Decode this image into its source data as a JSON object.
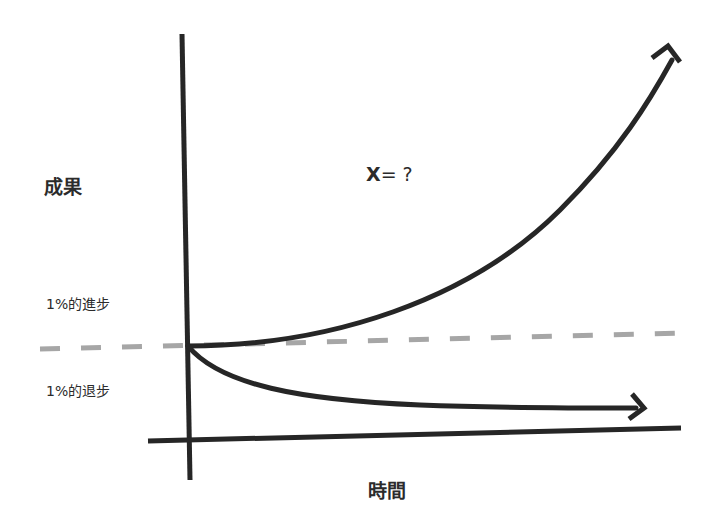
{
  "diagram": {
    "y_axis_label": "成果",
    "x_axis_label": "時間",
    "improve_label": "1%的進步",
    "decline_label": "1%的退步",
    "question": {
      "variable": "X",
      "rest": "= ?"
    },
    "colors": {
      "line": "#262626",
      "baseline_dashed": "#a6a6a6",
      "background": "#ffffff"
    },
    "curves": [
      {
        "name": "1% better every day",
        "shape": "exponential growth",
        "direction": "up-right"
      },
      {
        "name": "1% worse every day",
        "shape": "exponential decay",
        "direction": "down-right, flattening"
      }
    ]
  }
}
